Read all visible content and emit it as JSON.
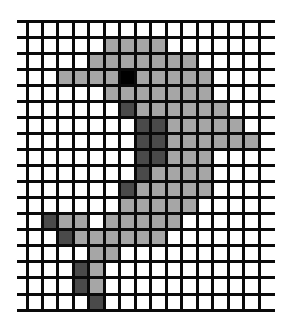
{
  "figure": {
    "grid": {
      "cols": 15,
      "rows": 18,
      "origin_x": 27,
      "origin_y": 21,
      "cell_w": 15.47,
      "cell_h": 16.06,
      "hline_left": 17,
      "hline_right": 275,
      "line_width": 3,
      "line_color": "#0a0a0a"
    },
    "palette": {
      "0": "#ffffff",
      "1": "#a6a6a6",
      "2": "#4a4a4a",
      "3": "#000000"
    },
    "legend": {
      "0": "empty",
      "1": "body-light-gray",
      "2": "shade-dark-gray",
      "3": "eye-black"
    },
    "cells": [
      [
        0,
        0,
        0,
        0,
        0,
        0,
        0,
        0,
        0,
        0,
        0,
        0,
        0,
        0,
        0
      ],
      [
        0,
        0,
        0,
        0,
        0,
        1,
        1,
        1,
        1,
        0,
        0,
        0,
        0,
        0,
        0
      ],
      [
        0,
        0,
        0,
        0,
        1,
        1,
        1,
        1,
        1,
        1,
        1,
        0,
        0,
        0,
        0
      ],
      [
        0,
        0,
        1,
        1,
        1,
        1,
        3,
        1,
        1,
        1,
        1,
        1,
        0,
        0,
        0
      ],
      [
        0,
        0,
        0,
        0,
        0,
        1,
        1,
        1,
        1,
        1,
        1,
        1,
        0,
        0,
        0
      ],
      [
        0,
        0,
        0,
        0,
        0,
        0,
        2,
        1,
        1,
        1,
        1,
        1,
        1,
        0,
        0
      ],
      [
        0,
        0,
        0,
        0,
        0,
        0,
        0,
        2,
        2,
        1,
        1,
        1,
        1,
        1,
        0
      ],
      [
        0,
        0,
        0,
        0,
        0,
        0,
        0,
        2,
        2,
        1,
        1,
        1,
        1,
        1,
        1
      ],
      [
        0,
        0,
        0,
        0,
        0,
        0,
        0,
        2,
        2,
        1,
        1,
        1,
        0,
        0,
        0
      ],
      [
        0,
        0,
        0,
        0,
        0,
        0,
        0,
        2,
        1,
        1,
        1,
        1,
        0,
        0,
        0
      ],
      [
        0,
        0,
        0,
        0,
        0,
        0,
        2,
        1,
        1,
        1,
        1,
        1,
        0,
        0,
        0
      ],
      [
        0,
        0,
        0,
        0,
        0,
        0,
        1,
        1,
        1,
        1,
        1,
        0,
        0,
        0,
        0
      ],
      [
        0,
        2,
        1,
        1,
        0,
        1,
        1,
        1,
        1,
        1,
        0,
        0,
        0,
        0,
        0
      ],
      [
        0,
        0,
        2,
        1,
        1,
        1,
        1,
        1,
        1,
        0,
        0,
        0,
        0,
        0,
        0
      ],
      [
        0,
        0,
        0,
        0,
        1,
        1,
        0,
        0,
        0,
        0,
        0,
        0,
        0,
        0,
        0
      ],
      [
        0,
        0,
        0,
        2,
        1,
        0,
        0,
        0,
        0,
        0,
        0,
        0,
        0,
        0,
        0
      ],
      [
        0,
        0,
        0,
        2,
        1,
        0,
        0,
        0,
        0,
        0,
        0,
        0,
        0,
        0,
        0
      ],
      [
        0,
        0,
        0,
        0,
        2,
        0,
        0,
        0,
        0,
        0,
        0,
        0,
        0,
        0,
        0
      ]
    ]
  }
}
